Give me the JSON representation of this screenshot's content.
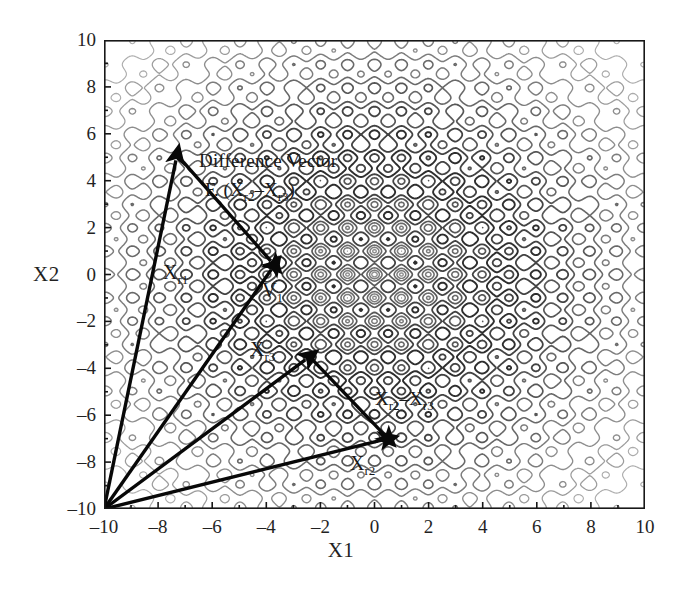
{
  "figure": {
    "xlabel": "X1",
    "ylabel": "X2"
  },
  "annotations": {
    "difference_vector_line1": "Difference Vector",
    "difference_vector_line2_prefix": "F. (X",
    "label_xr1": "X",
    "label_xr1_sub": "r1",
    "label_v1": "V",
    "label_v1_sub": "1",
    "label_xr3": "X",
    "label_xr3_sub": "r3",
    "label_xr2": "X",
    "label_xr2_sub": "r2",
    "diff_expr_a": "X",
    "diff_expr_a_sub": "r2",
    "diff_expr_minus": "–",
    "diff_expr_b": "X",
    "diff_expr_b_sub": "r3",
    "f_prefix": "F. (",
    "paren_close": ")"
  },
  "chart_data": {
    "type": "contour",
    "title": "",
    "xlabel": "X1",
    "ylabel": "X2",
    "xlim": [
      -10,
      10
    ],
    "ylim": [
      -10,
      10
    ],
    "xticks": [
      -10,
      -8,
      -6,
      -4,
      -2,
      0,
      2,
      4,
      6,
      8,
      10
    ],
    "yticks": [
      -10,
      -8,
      -6,
      -4,
      -2,
      0,
      2,
      4,
      6,
      8,
      10
    ],
    "xtick_labels": [
      "-10",
      "-8",
      "-6",
      "-4",
      "-2",
      "0",
      "2",
      "4",
      "6",
      "8",
      "10"
    ],
    "ytick_labels": [
      "-10",
      "-8",
      "-6",
      "-4",
      "-2",
      "0",
      "2",
      "4",
      "6",
      "8",
      "10"
    ],
    "grid": false,
    "legend": "none",
    "function": "rastrigin",
    "function_expr": "20 + x^2 + y^2 - 10*cos(2*pi*x) - 10*cos(2*pi*y)",
    "contour_levels": [
      2,
      6,
      12,
      20,
      30,
      42,
      56,
      72,
      90,
      110,
      132,
      156,
      182
    ],
    "colors": {
      "contour_inner": "#3a3a3a",
      "contour_outer": "#8a8a8a",
      "axis": "#111111",
      "vector": "#000000",
      "background": "#ffffff"
    },
    "vectors": [
      {
        "name": "X_r1",
        "from": [
          -10,
          -10
        ],
        "to": [
          -7.3,
          5.1
        ],
        "label": "Xr1"
      },
      {
        "name": "V_1",
        "from": [
          -10,
          -10
        ],
        "to": [
          -3.7,
          0.4
        ],
        "label": "V1"
      },
      {
        "name": "X_r3",
        "from": [
          -10,
          -10
        ],
        "to": [
          -2.4,
          -3.5
        ],
        "label": "Xr3"
      },
      {
        "name": "X_r2",
        "from": [
          -10,
          -10
        ],
        "to": [
          0.5,
          -7.0
        ],
        "label": "Xr2"
      },
      {
        "name": "F_diff",
        "from": [
          -7.3,
          5.1
        ],
        "to": [
          -3.7,
          0.4
        ],
        "label": "F.(Xr2-Xr3)"
      },
      {
        "name": "Xr2_minus_Xr3",
        "from": [
          -2.4,
          -3.5
        ],
        "to": [
          0.5,
          -7.0
        ],
        "label": "Xr2-Xr3"
      }
    ]
  }
}
